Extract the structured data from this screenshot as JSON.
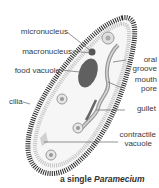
{
  "labels": {
    "micronucleus": "micronucleus",
    "macronucleus": "macronucleus",
    "food_vacuole": "food vacuole",
    "cilia": "cilia",
    "oral_groove_1": "oral",
    "oral_groove_2": "groove",
    "mouth_pore_1": "mouth",
    "mouth_pore_2": "pore",
    "gullet": "gullet",
    "contractile_vacuole_1": "contractile",
    "contractile_vacuole_2": "vacuole"
  },
  "caption": {
    "prefix": "a single ",
    "organism": "Paramecium"
  },
  "colors": {
    "cilia": "#2a2a2a",
    "body_fill": "#f4f4f4",
    "inner_ring": "#bdbdbd",
    "nucleus": "#555555",
    "gullet": "#8a8a8a",
    "leader": "#666666"
  }
}
